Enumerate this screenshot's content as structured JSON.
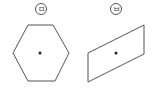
{
  "figures": [
    {
      "label": "ㅁ",
      "shape": "hexagon",
      "center_point": true,
      "points": "28,25 53,25 69,53 55,81 28,81 13,53",
      "center": [
        40,
        53
      ]
    },
    {
      "label": "ㅂ",
      "shape": "parallelogram",
      "center_point": true,
      "points": "88,53 144,25 144,54 88,82",
      "center": [
        116,
        53
      ]
    }
  ],
  "colors": {
    "stroke": "#555555",
    "dot": "#222222"
  }
}
